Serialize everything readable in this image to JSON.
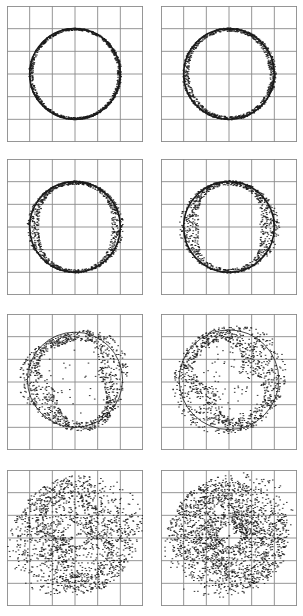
{
  "figure": {
    "layout": {
      "rows": 4,
      "cols": 2,
      "grid_divisions": 6
    },
    "colors": {
      "grid": "#8a8a8a",
      "ink": "#1a1a1a",
      "background": "#ffffff"
    }
  },
  "chart_data": [
    {
      "type": "scatter",
      "panel": 1,
      "title": "",
      "xlabel": "",
      "ylabel": "",
      "xlim": [
        0,
        6
      ],
      "ylim": [
        0,
        6
      ],
      "grid": true,
      "ring": {
        "cx": 3,
        "cy": 3,
        "r": 2.0,
        "thickness": 0.04,
        "lobe_amp": 0.06,
        "lobes": 2,
        "rotation_deg": 0,
        "scatter": 0.0
      }
    },
    {
      "type": "scatter",
      "panel": 2,
      "title": "",
      "xlabel": "",
      "ylabel": "",
      "xlim": [
        0,
        6
      ],
      "ylim": [
        0,
        6
      ],
      "grid": true,
      "ring": {
        "cx": 3,
        "cy": 3,
        "r": 2.0,
        "thickness": 0.06,
        "lobe_amp": 0.12,
        "lobes": 2,
        "rotation_deg": 10,
        "scatter": 0.0
      }
    },
    {
      "type": "scatter",
      "panel": 3,
      "title": "",
      "xlabel": "",
      "ylabel": "",
      "xlim": [
        0,
        6
      ],
      "ylim": [
        0,
        6
      ],
      "grid": true,
      "ring": {
        "cx": 3,
        "cy": 3,
        "r": 2.0,
        "thickness": 0.06,
        "lobe_amp": 0.3,
        "lobes": 2,
        "rotation_deg": 0,
        "scatter": 0.0
      }
    },
    {
      "type": "scatter",
      "panel": 4,
      "title": "",
      "xlabel": "",
      "ylabel": "",
      "xlim": [
        0,
        6
      ],
      "ylim": [
        0,
        6
      ],
      "grid": true,
      "ring": {
        "cx": 3,
        "cy": 3,
        "r": 2.0,
        "thickness": 0.08,
        "lobe_amp": 0.55,
        "lobes": 2,
        "rotation_deg": 0,
        "scatter": 0.0
      }
    },
    {
      "type": "scatter",
      "panel": 5,
      "title": "",
      "xlabel": "",
      "ylabel": "",
      "xlim": [
        0,
        6
      ],
      "ylim": [
        0,
        6
      ],
      "grid": true,
      "ring": {
        "cx": 3,
        "cy": 3.1,
        "r": 2.1,
        "thickness": 0.15,
        "lobe_amp": 0.75,
        "lobes": 3,
        "rotation_deg": 20,
        "scatter": 0.05
      }
    },
    {
      "type": "scatter",
      "panel": 6,
      "title": "",
      "xlabel": "",
      "ylabel": "",
      "xlim": [
        0,
        6
      ],
      "ylim": [
        0,
        6
      ],
      "grid": true,
      "ring": {
        "cx": 3,
        "cy": 3.1,
        "r": 2.2,
        "thickness": 0.2,
        "lobe_amp": 1.0,
        "lobes": 2,
        "rotation_deg": 35,
        "scatter": 0.15
      }
    },
    {
      "type": "scatter",
      "panel": 7,
      "title": "",
      "xlabel": "",
      "ylabel": "",
      "xlim": [
        0,
        6
      ],
      "ylim": [
        0,
        6
      ],
      "grid": true,
      "ring": {
        "cx": 3,
        "cy": 3.1,
        "r": 2.4,
        "thickness": 0.3,
        "lobe_amp": 1.5,
        "lobes": 2,
        "rotation_deg": 30,
        "scatter": 0.6
      }
    },
    {
      "type": "scatter",
      "panel": 8,
      "title": "",
      "xlabel": "",
      "ylabel": "",
      "xlim": [
        0,
        6
      ],
      "ylim": [
        0,
        6
      ],
      "grid": true,
      "ring": {
        "cx": 3,
        "cy": 3.1,
        "r": 2.4,
        "thickness": 0.3,
        "lobe_amp": 1.6,
        "lobes": 2,
        "rotation_deg": 40,
        "scatter": 0.9
      }
    }
  ]
}
